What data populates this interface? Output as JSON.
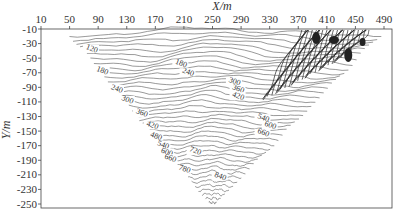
{
  "chart_data": {
    "type": "contour",
    "title": "",
    "xlabel": "X/m",
    "ylabel": "Y/m",
    "xlim": [
      10,
      500
    ],
    "ylim": [
      -255,
      -10
    ],
    "x_ticks": [
      10,
      50,
      90,
      130,
      170,
      210,
      250,
      290,
      330,
      370,
      410,
      450,
      490
    ],
    "y_ticks": [
      -10,
      -30,
      -50,
      -70,
      -90,
      -110,
      -130,
      -150,
      -170,
      -190,
      -210,
      -230,
      -250
    ],
    "x_axis_position": "top",
    "grid": false,
    "legend": null,
    "domain_shape": "inverted triangle, vertices approx (50,-10), (490,-10), (250,-250)",
    "contour_levels_labeled": [
      120,
      180,
      240,
      300,
      360,
      420,
      480,
      540,
      600,
      660,
      720,
      780,
      840
    ],
    "contour_interval_estimate": 20,
    "annotations": [
      {
        "text": "120",
        "x": 80,
        "y": -40
      },
      {
        "text": "180",
        "x": 95,
        "y": -70
      },
      {
        "text": "240",
        "x": 115,
        "y": -95
      },
      {
        "text": "300",
        "x": 130,
        "y": -110
      },
      {
        "text": "360",
        "x": 150,
        "y": -128
      },
      {
        "text": "420",
        "x": 165,
        "y": -145
      },
      {
        "text": "480",
        "x": 170,
        "y": -160
      },
      {
        "text": "540",
        "x": 180,
        "y": -172
      },
      {
        "text": "600",
        "x": 185,
        "y": -182
      },
      {
        "text": "660",
        "x": 190,
        "y": -190
      },
      {
        "text": "180",
        "x": 205,
        "y": -60
      },
      {
        "text": "240",
        "x": 215,
        "y": -72
      },
      {
        "text": "300",
        "x": 280,
        "y": -85
      },
      {
        "text": "360",
        "x": 285,
        "y": -95
      },
      {
        "text": "420",
        "x": 285,
        "y": -105
      },
      {
        "text": "720",
        "x": 225,
        "y": -180
      },
      {
        "text": "780",
        "x": 210,
        "y": -205
      },
      {
        "text": "840",
        "x": 260,
        "y": -215
      },
      {
        "text": "540",
        "x": 320,
        "y": -135
      },
      {
        "text": "600",
        "x": 330,
        "y": -145
      },
      {
        "text": "660",
        "x": 320,
        "y": -155
      }
    ]
  },
  "labels": {
    "x_axis_title": "X/m",
    "y_axis_title": "Y/m"
  }
}
